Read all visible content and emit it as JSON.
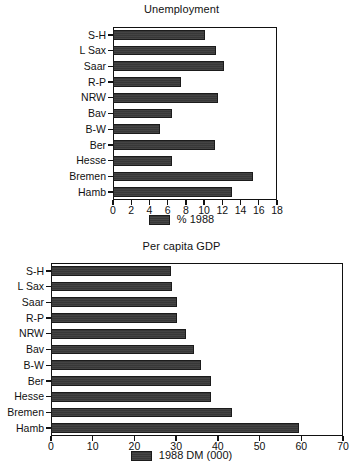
{
  "chart_data": [
    {
      "id": "unemployment",
      "type": "bar",
      "orientation": "horizontal",
      "title": "Unemployment",
      "xlabel": "",
      "ylabel": "",
      "xlim": [
        0,
        18
      ],
      "xticks": [
        0,
        2,
        4,
        6,
        8,
        10,
        12,
        14,
        16,
        18
      ],
      "xtick_labels": [
        "0",
        "2",
        "4",
        "6",
        "8",
        "10",
        "12",
        "14",
        "16",
        "18"
      ],
      "grid": false,
      "legend_position": "bottom-center",
      "legend": [
        "% 1988"
      ],
      "series_name": "% 1988",
      "categories": [
        "S-H",
        "L Sax",
        "Saar",
        "R-P",
        "NRW",
        "Bav",
        "B-W",
        "Ber",
        "Hesse",
        "Bremen",
        "Hamb"
      ],
      "values": [
        10.1,
        11.3,
        12.2,
        7.5,
        11.5,
        6.5,
        5.2,
        11.2,
        6.5,
        15.4,
        13.1
      ]
    },
    {
      "id": "gdp",
      "type": "bar",
      "orientation": "horizontal",
      "title": "Per capita GDP",
      "xlabel": "",
      "ylabel": "",
      "xlim": [
        0,
        70
      ],
      "xticks": [
        0,
        10,
        20,
        30,
        40,
        50,
        60,
        70
      ],
      "xtick_labels": [
        "0",
        "10",
        "20",
        "30",
        "40",
        "50",
        "60",
        "70"
      ],
      "grid": false,
      "legend_position": "bottom-center",
      "legend": [
        "1988 DM (000)"
      ],
      "series_name": "1988 DM (000)",
      "categories": [
        "S-H",
        "L Sax",
        "Saar",
        "R-P",
        "NRW",
        "Bav",
        "B-W",
        "Ber",
        "Hesse",
        "Bremen",
        "Hamb"
      ],
      "values": [
        28.8,
        29.0,
        30.2,
        30.2,
        32.4,
        34.3,
        36.0,
        38.4,
        38.4,
        43.4,
        59.5
      ]
    }
  ],
  "colors": {
    "bar_fill": "#383838",
    "bar_edge": "#1b1b1b",
    "axis": "#111111",
    "background": "#ffffff"
  }
}
